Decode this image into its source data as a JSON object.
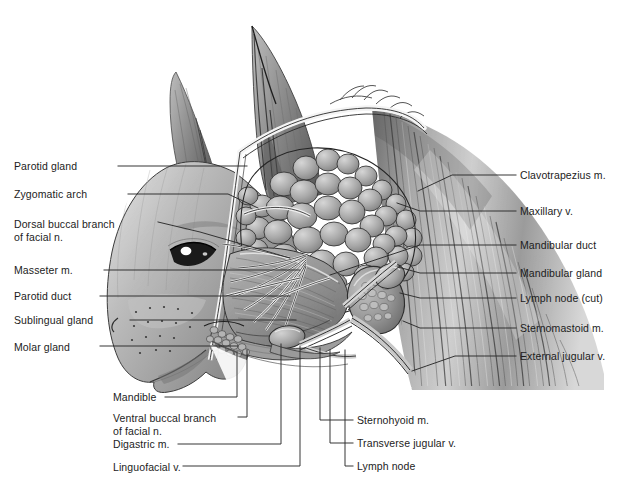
{
  "figure": {
    "style": "grayscale airbrush anatomical illustration",
    "colors": {
      "background": "#ffffff",
      "leader_line": "#2b2b2b",
      "label_text": "#1c1c1c",
      "fur_light": "#c9c9c9",
      "fur_mid": "#9e9e9e",
      "fur_dark": "#6a6a6a",
      "gland_lobule": "#a5a5a5",
      "gland_lobule_light": "#c6c6c6",
      "gland_outline": "#3a3a3a",
      "muscle_mid": "#8e8e8e",
      "muscle_dark": "#565656",
      "vessel": "#efefef",
      "nerve": "#f2f2f2"
    }
  },
  "labels_left": [
    {
      "id": "parotid-gland",
      "text": "Parotid gland",
      "x": 14,
      "y": 160,
      "line": "M 118 166 L 247 166"
    },
    {
      "id": "zygomatic-arch",
      "text": "Zygomatic arch",
      "x": 14,
      "y": 188,
      "line": "M 128 194 L 228 194 L 258 208"
    },
    {
      "id": "dorsal-buccal-branch",
      "text": "Dorsal buccal branch",
      "x": 14,
      "y": 218,
      "text2": "of facial n.",
      "y2": 231,
      "line": "M 158 222 L 200 232 L 290 258"
    },
    {
      "id": "masseter-m",
      "text": "Masseter m.",
      "x": 14,
      "y": 264,
      "line": "M 104 270 L 300 270"
    },
    {
      "id": "parotid-duct",
      "text": "Parotid duct",
      "x": 14,
      "y": 290,
      "line": "M 100 296 L 290 296"
    },
    {
      "id": "sublingual-gland",
      "text": "Sublingual gland",
      "x": 14,
      "y": 314,
      "line": "M 130 320 L 296 320"
    },
    {
      "id": "molar-gland",
      "text": "Molar gland",
      "x": 14,
      "y": 341,
      "line": "M 100 346 L 238 346"
    }
  ],
  "labels_right": [
    {
      "id": "clavotrapezius-m",
      "text": "Clavotrapezius m.",
      "x": 520,
      "y": 169,
      "line": "M 516 175 L 452 175 L 418 191"
    },
    {
      "id": "maxillary-v",
      "text": "Maxillary v.",
      "x": 520,
      "y": 205,
      "line": "M 516 211 L 420 211 L 397 203"
    },
    {
      "id": "mandibular-duct",
      "text": "Mandibular duct",
      "x": 520,
      "y": 239,
      "line": "M 516 245 L 420 245 L 330 275"
    },
    {
      "id": "mandibular-gland",
      "text": "Mandibular gland",
      "x": 520,
      "y": 267,
      "line": "M 516 273 L 420 273 L 398 267"
    },
    {
      "id": "lymph-node-cut",
      "text": "Lymph node (cut)",
      "x": 520,
      "y": 292,
      "line": "M 516 298 L 420 298 L 400 293"
    },
    {
      "id": "sternomastoid-m",
      "text": "Sternomastoid m.",
      "x": 520,
      "y": 322,
      "line": "M 516 328 L 420 328 L 403 321"
    },
    {
      "id": "external-jugular-v",
      "text": "External jugular v.",
      "x": 520,
      "y": 350,
      "line": "M 516 356 L 455 356 L 412 371"
    }
  ],
  "labels_bottom_left": [
    {
      "id": "mandible",
      "text": "Mandible",
      "x": 113,
      "y": 391,
      "line": "M 165 397 L 237 397 L 237 352"
    },
    {
      "id": "ventral-buccal-branch",
      "text": "Ventral buccal branch",
      "x": 113,
      "y": 412,
      "text2": "of facial n.",
      "y2": 425,
      "line": "M 238 417 L 247 417 L 247 350"
    },
    {
      "id": "digastric-m",
      "text": "Digastric m.",
      "x": 113,
      "y": 438,
      "line": "M 178 444 L 281 444 L 281 344"
    },
    {
      "id": "linguofacial-v",
      "text": "Linguofacial v.",
      "x": 113,
      "y": 461,
      "line": "M 183 466 L 300 466 L 300 346"
    }
  ],
  "labels_bottom_right": [
    {
      "id": "sternohyoid-m",
      "text": "Sternohyoid m.",
      "x": 357,
      "y": 414,
      "line": "M 353 420 L 320 420 L 320 348"
    },
    {
      "id": "transverse-jugular-v",
      "text": "Transverse jugular v.",
      "x": 357,
      "y": 437,
      "line": "M 353 443 L 330 443 L 330 350"
    },
    {
      "id": "lymph-node",
      "text": "Lymph node",
      "x": 357,
      "y": 460,
      "line": "M 353 466 L 345 466 L 345 350"
    }
  ]
}
